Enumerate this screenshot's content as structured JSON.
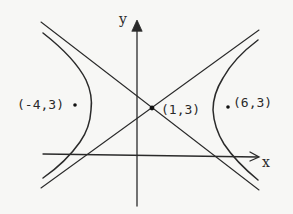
{
  "diagram": {
    "type": "hyperbola",
    "axes": {
      "x_label": "x",
      "y_label": "y"
    },
    "points": {
      "center": {
        "label": "(1,3)",
        "x": 1,
        "y": 3
      },
      "left_focus": {
        "label": "(-4,3)",
        "x": -4,
        "y": 3
      },
      "right_focus": {
        "label": "(6,3)",
        "x": 6,
        "y": 3
      }
    },
    "elements": [
      "left branch",
      "right branch",
      "asymptote (negative slope)",
      "asymptote (positive slope)"
    ],
    "colors": {
      "ink": "#2a2a2a",
      "background": "#f7f7f5"
    }
  }
}
